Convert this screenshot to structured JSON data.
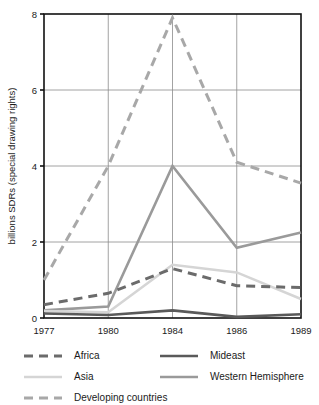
{
  "chart_data": {
    "type": "line",
    "title": "",
    "xlabel": "",
    "ylabel": "billions SDRs (special drawing rights)",
    "categories": [
      "1977",
      "1980",
      "1984",
      "1986",
      "1989"
    ],
    "x_tick_labels": [
      "1977",
      "1980",
      "1984",
      "1986",
      "1989"
    ],
    "y_tick_labels": [
      "0",
      "2",
      "4",
      "6",
      "8"
    ],
    "y_tick_values": [
      0,
      2,
      4,
      6,
      8
    ],
    "ylim": [
      0,
      8
    ],
    "grid": "horizontal-and-vertical",
    "grid_y_values": [
      2,
      4,
      6
    ],
    "grid_x_categories": [
      "1980",
      "1984",
      "1986"
    ],
    "legend_position": "below-plot",
    "series": [
      {
        "name": "Africa",
        "values": [
          0.35,
          0.65,
          1.3,
          0.85,
          0.8
        ],
        "color": "#6b6b6b",
        "style": "dashed",
        "width": 3.0,
        "dash": "9,6"
      },
      {
        "name": "Asia",
        "values": [
          0.18,
          0.15,
          1.4,
          1.2,
          0.5
        ],
        "color": "#d5d5d5",
        "style": "solid",
        "width": 2.6,
        "dash": ""
      },
      {
        "name": "Developing countries",
        "values": [
          1.0,
          4.0,
          7.9,
          4.1,
          3.55
        ],
        "color": "#a8a8a8",
        "style": "dashed",
        "width": 3.0,
        "dash": "9,6"
      },
      {
        "name": "Mideast",
        "values": [
          0.12,
          0.08,
          0.2,
          0.03,
          0.1
        ],
        "color": "#5a5a5a",
        "style": "solid",
        "width": 2.6,
        "dash": ""
      },
      {
        "name": "Western Hemisphere",
        "values": [
          0.2,
          0.3,
          4.0,
          1.85,
          2.25
        ],
        "color": "#9a9a9a",
        "style": "solid",
        "width": 2.6,
        "dash": ""
      }
    ]
  },
  "legend": {
    "entries": [
      {
        "label": "Africa",
        "column": 0,
        "row": 0
      },
      {
        "label": "Mideast",
        "column": 1,
        "row": 0
      },
      {
        "label": "Asia",
        "column": 0,
        "row": 1
      },
      {
        "label": "Western Hemisphere",
        "column": 1,
        "row": 1
      },
      {
        "label": "Developing countries",
        "column": 0,
        "row": 2
      }
    ]
  },
  "colors": {
    "background": "#ffffff",
    "frame": "#111111",
    "grid": "#8c8c8c",
    "text": "#1a1a1a"
  }
}
